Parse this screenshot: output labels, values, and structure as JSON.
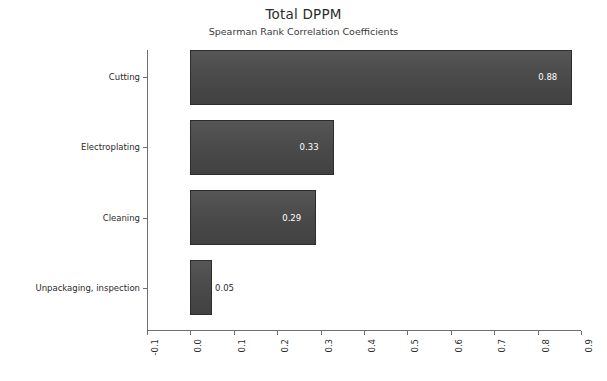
{
  "chart_data": {
    "type": "bar",
    "orientation": "horizontal",
    "title": "Total DPPM",
    "subtitle": "Spearman Rank Correlation Coefficients",
    "xlabel": "",
    "ylabel": "",
    "categories": [
      "Cutting",
      "Electroplating",
      "Cleaning",
      "Unpackaging, inspection"
    ],
    "values": [
      0.88,
      0.33,
      0.29,
      0.05
    ],
    "value_labels": [
      "0.88",
      "0.33",
      "0.29",
      "0.05"
    ],
    "xlim": [
      -0.1,
      0.9
    ],
    "xticks": [
      -0.1,
      0.0,
      0.1,
      0.2,
      0.3,
      0.4,
      0.5,
      0.6,
      0.7,
      0.8,
      0.9
    ],
    "xtick_labels": [
      "-0.1",
      "0.0",
      "0.1",
      "0.2",
      "0.3",
      "0.4",
      "0.5",
      "0.6",
      "0.7",
      "0.8",
      "0.9"
    ],
    "grid": false,
    "legend": false,
    "bar_color": "#4b4b4b",
    "bar_border_color": "#2d2d2d",
    "background_color": "#ffffff",
    "axis_color": "#6e6e6e",
    "label_color_inside": "#ffffff",
    "label_color_outside": "#2b2b2b"
  }
}
